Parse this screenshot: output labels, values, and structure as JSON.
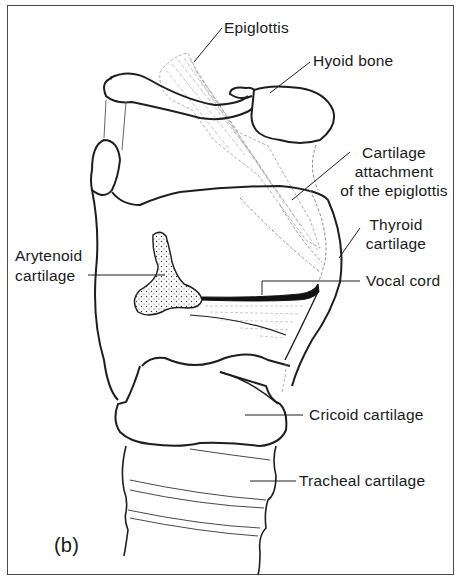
{
  "figure": {
    "panel_label": "(b)",
    "labels": {
      "epiglottis": "Epiglottis",
      "hyoid_bone": "Hyoid bone",
      "cartilage_attachment_line1": "Cartilage",
      "cartilage_attachment_line2": "attachment",
      "cartilage_attachment_line3": "of the epiglottis",
      "thyroid_line1": "Thyroid",
      "thyroid_line2": "cartilage",
      "arytenoid_line1": "Arytenoid",
      "arytenoid_line2": "cartilage",
      "vocal_cord": "Vocal cord",
      "cricoid": "Cricoid cartilage",
      "tracheal": "Tracheal cartilage"
    }
  },
  "colors": {
    "line": "#1e1e1e",
    "faint_line": "#8a8a8a",
    "border": "#4a4a4a",
    "background": "#ffffff"
  }
}
